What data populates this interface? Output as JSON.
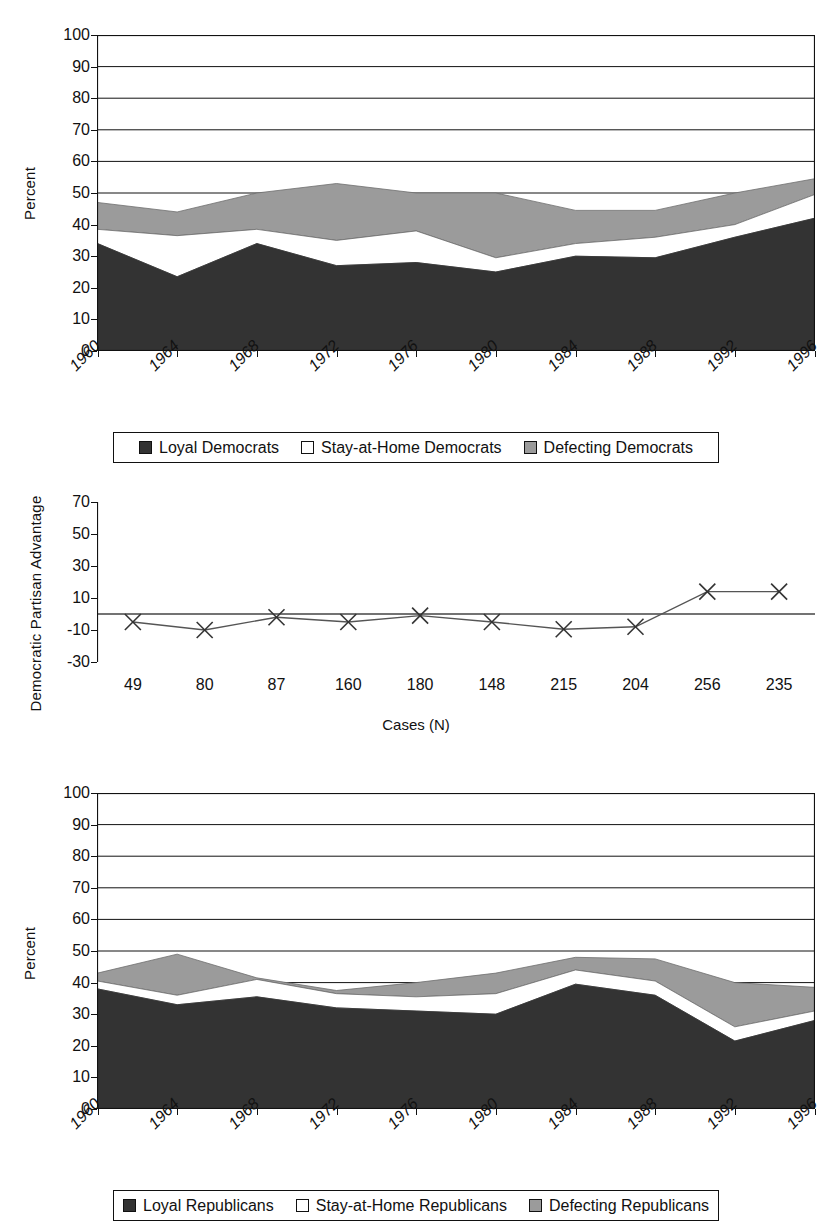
{
  "page": {
    "background": "#ffffff",
    "width": 832,
    "height": 1228
  },
  "colors": {
    "loyal": "#333333",
    "stay_home": "#ffffff",
    "defecting": "#9b9b9b",
    "axis": "#111111",
    "line": "#555555"
  },
  "chart1": {
    "ylabel": "Percent",
    "yticks": [
      "0",
      "10",
      "20",
      "30",
      "40",
      "50",
      "60",
      "70",
      "80",
      "90",
      "100"
    ],
    "xticks": [
      "1960",
      "1964",
      "1968",
      "1972",
      "1976",
      "1980",
      "1984",
      "1988",
      "1992",
      "1996"
    ],
    "legend": [
      {
        "label": "Loyal Democrats",
        "swatch": "loyal"
      },
      {
        "label": "Stay-at-Home Democrats",
        "swatch": "stay_home"
      },
      {
        "label": "Defecting Democrats",
        "swatch": "defecting"
      }
    ]
  },
  "chart2": {
    "ylabel": "Democratic Partisan Advantage",
    "xlabel": "Cases (N)",
    "yticks": [
      "-30",
      "-10",
      "10",
      "30",
      "50",
      "70"
    ],
    "xticks": [
      "49",
      "80",
      "87",
      "160",
      "180",
      "148",
      "215",
      "204",
      "256",
      "235"
    ]
  },
  "chart3": {
    "ylabel": "Percent",
    "yticks": [
      "0",
      "10",
      "20",
      "30",
      "40",
      "50",
      "60",
      "70",
      "80",
      "90",
      "100"
    ],
    "xticks": [
      "1960",
      "1964",
      "1968",
      "1972",
      "1976",
      "1980",
      "1984",
      "1988",
      "1992",
      "1996"
    ],
    "legend": [
      {
        "label": "Loyal Republicans",
        "swatch": "loyal"
      },
      {
        "label": "Stay-at-Home Republicans",
        "swatch": "stay_home"
      },
      {
        "label": "Defecting Republicans",
        "swatch": "defecting"
      }
    ]
  },
  "chart_data": [
    {
      "type": "area",
      "id": "democrats",
      "title": "",
      "xlabel": "",
      "ylabel": "Percent",
      "categories": [
        "1960",
        "1964",
        "1968",
        "1972",
        "1976",
        "1980",
        "1984",
        "1988",
        "1992",
        "1996"
      ],
      "ylim": [
        0,
        100
      ],
      "yticks": [
        0,
        10,
        20,
        30,
        40,
        50,
        60,
        70,
        80,
        90,
        100
      ],
      "grid": true,
      "stacked": true,
      "legend_position": "bottom",
      "series": [
        {
          "name": "Loyal Democrats",
          "color": "#333333",
          "values": [
            34.0,
            23.5,
            34.0,
            27.0,
            28.0,
            25.0,
            30.0,
            29.5,
            36.0,
            42.0
          ]
        },
        {
          "name": "Stay-at-Home Democrats",
          "color": "#ffffff",
          "values": [
            4.5,
            13.0,
            4.5,
            8.0,
            10.0,
            4.5,
            4.0,
            6.5,
            4.0,
            7.5
          ]
        },
        {
          "name": "Defecting Democrats",
          "color": "#9b9b9b",
          "values": [
            8.5,
            7.5,
            11.5,
            18.0,
            12.0,
            20.5,
            10.5,
            8.5,
            10.0,
            5.0
          ]
        }
      ],
      "cumulative_tops": {
        "loyal": [
          34.0,
          23.5,
          34.0,
          27.0,
          28.0,
          25.0,
          30.0,
          29.5,
          36.0,
          42.0
        ],
        "loyal_plus_stay": [
          38.5,
          36.5,
          38.5,
          35.0,
          38.0,
          29.5,
          34.0,
          36.0,
          40.0,
          49.5
        ],
        "total": [
          47.0,
          44.0,
          50.0,
          53.0,
          50.0,
          50.0,
          44.5,
          44.5,
          50.0,
          54.5
        ]
      }
    },
    {
      "type": "line",
      "id": "partisan-advantage",
      "title": "",
      "xlabel": "Cases (N)",
      "ylabel": "Democratic Partisan Advantage",
      "categories": [
        "49",
        "80",
        "87",
        "160",
        "180",
        "148",
        "215",
        "204",
        "256",
        "235"
      ],
      "ylim": [
        -30,
        70
      ],
      "yticks": [
        -30,
        -10,
        10,
        30,
        50,
        70
      ],
      "grid": false,
      "zero_line": true,
      "marker": "x",
      "legend_position": "none",
      "series": [
        {
          "name": "Democratic Partisan Advantage",
          "color": "#555555",
          "values": [
            -5.0,
            -10.0,
            -2.0,
            -5.0,
            -1.0,
            -5.0,
            -9.5,
            -8.0,
            14.0,
            14.0
          ]
        }
      ]
    },
    {
      "type": "area",
      "id": "republicans",
      "title": "",
      "xlabel": "",
      "ylabel": "Percent",
      "categories": [
        "1960",
        "1964",
        "1968",
        "1972",
        "1976",
        "1980",
        "1984",
        "1988",
        "1992",
        "1996"
      ],
      "ylim": [
        0,
        100
      ],
      "yticks": [
        0,
        10,
        20,
        30,
        40,
        50,
        60,
        70,
        80,
        90,
        100
      ],
      "grid": true,
      "stacked": true,
      "legend_position": "bottom",
      "series": [
        {
          "name": "Loyal Republicans",
          "color": "#333333",
          "values": [
            38.0,
            33.0,
            35.5,
            32.0,
            31.0,
            30.0,
            39.5,
            36.0,
            21.5,
            28.0
          ]
        },
        {
          "name": "Stay-at-Home Republicans",
          "color": "#ffffff",
          "values": [
            2.5,
            3.0,
            5.5,
            4.5,
            4.5,
            6.5,
            4.5,
            4.5,
            4.5,
            3.0
          ]
        },
        {
          "name": "Defecting Republicans",
          "color": "#9b9b9b",
          "values": [
            2.5,
            13.0,
            0.5,
            1.0,
            4.5,
            6.5,
            4.0,
            7.0,
            14.0,
            7.5
          ]
        }
      ],
      "cumulative_tops": {
        "loyal": [
          38.0,
          33.0,
          35.5,
          32.0,
          31.0,
          30.0,
          39.5,
          36.0,
          21.5,
          28.0
        ],
        "loyal_plus_stay": [
          40.5,
          36.0,
          41.0,
          36.5,
          35.5,
          36.5,
          44.0,
          40.5,
          26.0,
          31.0
        ],
        "total": [
          43.0,
          49.0,
          41.5,
          37.5,
          40.0,
          43.0,
          48.0,
          47.5,
          40.0,
          38.5
        ]
      }
    }
  ]
}
